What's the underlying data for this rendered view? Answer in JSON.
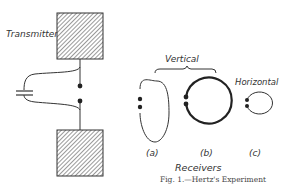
{
  "figure": {
    "caption": "Fig. 1.—Hertz's Experiment",
    "transmitter_label": "Transmitter",
    "group_label": "Vertical",
    "horizontal_label": "Horizontal",
    "receivers_label": "Receivers",
    "receivers": [
      {
        "id": "a",
        "label": "(a)",
        "orientation": "vertical"
      },
      {
        "id": "b",
        "label": "(b)",
        "orientation": "vertical"
      },
      {
        "id": "c",
        "label": "(c)",
        "orientation": "horizontal"
      }
    ]
  }
}
